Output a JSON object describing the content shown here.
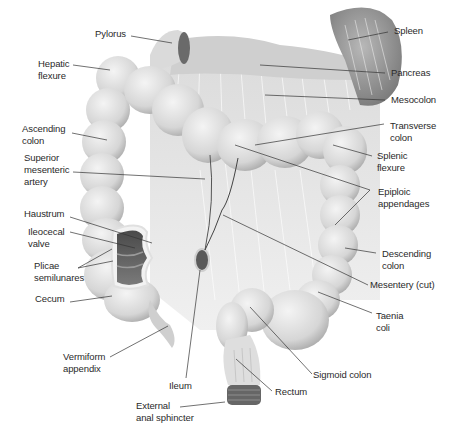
{
  "figure": {
    "colors": {
      "background": "#ffffff",
      "tissue_light": "#e8e8e8",
      "tissue_mid": "#c9c9c9",
      "tissue_dark": "#8a8a8a",
      "lumen_dark": "#5a5a5a",
      "leader_line": "#333333",
      "label_text": "#2a2a2a"
    }
  },
  "labels": {
    "pylorus": "Pylorus",
    "hepatic_flexure": "Hepatic\nflexure",
    "ascending_colon": "Ascending\ncolon",
    "superior_mesenteric_artery": "Superior\nmesenteric\nartery",
    "haustrum": "Haustrum",
    "ileocecal_valve": "Ileocecal\nvalve",
    "plicae_semilunares": "Plicae\nsemilunares",
    "cecum": "Cecum",
    "vermiform_appendix": "Vermiform\nappendix",
    "ileum": "Ileum",
    "external_anal_sphincter": "External\nanal sphincter",
    "spleen": "Spleen",
    "pancreas": "Pancreas",
    "mesocolon": "Mesocolon",
    "transverse_colon": "Transverse\ncolon",
    "splenic_flexure": "Splenic\nflexure",
    "epiploic_appendages": "Epiploic\nappendages",
    "descending_colon": "Descending\ncolon",
    "mesentery_cut": "Mesentery (cut)",
    "taenia_coli": "Taenia\ncoli",
    "sigmoid_colon": "Sigmoid colon",
    "rectum": "Rectum"
  }
}
